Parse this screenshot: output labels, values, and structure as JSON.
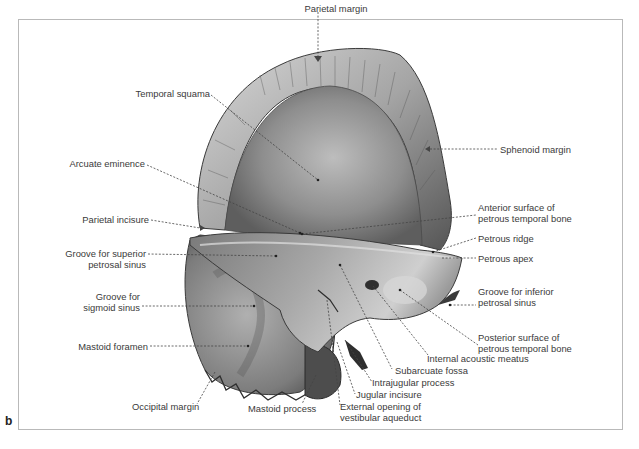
{
  "figure": {
    "letter": "b"
  },
  "labels": {
    "parietal_margin": "Parietal margin",
    "temporal_squama": "Temporal squama",
    "sphenoid_margin": "Sphenoid margin",
    "arcuate_eminence": "Arcuate eminence",
    "anterior_surface_1": "Anterior surface of",
    "anterior_surface_2": "petrous temporal bone",
    "parietal_incisure": "Parietal incisure",
    "petrous_ridge": "Petrous ridge",
    "groove_superior_1": "Groove for superior",
    "groove_superior_2": "petrosal sinus",
    "petrous_apex": "Petrous apex",
    "groove_inferior_1": "Groove for inferior",
    "groove_inferior_2": "petrosal sinus",
    "groove_sigmoid_1": "Groove for",
    "groove_sigmoid_2": "sigmoid sinus",
    "posterior_surface_1": "Posterior surface of",
    "posterior_surface_2": "petrous temporal bone",
    "internal_acoustic_meatus": "Internal acoustic meatus",
    "mastoid_foramen": "Mastoid foramen",
    "subarcuate_fossa": "Subarcuate fossa",
    "intrajugular_process": "Intrajugular process",
    "jugular_incisure": "Jugular incisure",
    "occipital_margin": "Occipital margin",
    "mastoid_process": "Mastoid process",
    "external_opening_1": "External opening of",
    "external_opening_2": "vestibular aqueduct"
  },
  "colors": {
    "frame_border": "#b9b9b9",
    "label_text": "#3a3a3a",
    "leader_line": "#444444",
    "bone_light": "#c9c9c9",
    "bone_mid": "#9a9a9a",
    "bone_dark": "#4a4a4a"
  }
}
